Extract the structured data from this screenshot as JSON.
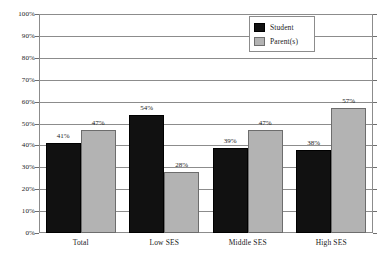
{
  "chart_data": {
    "type": "bar",
    "title": "",
    "subtitle": "",
    "xlabel": "",
    "ylabel": "",
    "categories": [
      "Total",
      "Low SES",
      "Middle SES",
      "High SES"
    ],
    "series": [
      {
        "name": "Student",
        "color": "#111111",
        "values": [
          41,
          54,
          39,
          38
        ],
        "value_labels": [
          "41%",
          "54%",
          "39%",
          "38%"
        ]
      },
      {
        "name": "Parent(s)",
        "color": "#b3b3b3",
        "values": [
          47,
          28,
          47,
          57
        ],
        "value_labels": [
          "47%",
          "28%",
          "47%",
          "57%"
        ]
      }
    ],
    "ylim": [
      0,
      100
    ],
    "ytick_values": [
      0,
      10,
      20,
      30,
      40,
      50,
      60,
      70,
      80,
      90,
      100
    ],
    "ytick_labels": [
      "0%",
      "10%",
      "20%",
      "30%",
      "40%",
      "50%",
      "60%",
      "70%",
      "80%",
      "90%",
      "100%"
    ],
    "grid": true,
    "grid_axis": "y",
    "legend_position": "top-right",
    "legend_entries": [
      "Student",
      "Parent(s)"
    ],
    "value_label_suffix": "%",
    "background_color": "#ffffff",
    "axis_color": "#8c8c8c"
  }
}
